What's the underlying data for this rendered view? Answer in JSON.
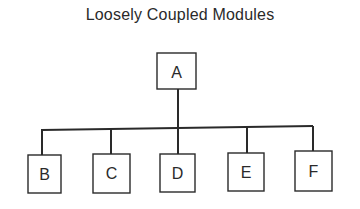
{
  "title": "Loosely Coupled Modules",
  "colors": {
    "stroke": "#2a2a2a",
    "background": "#ffffff"
  },
  "root": {
    "id": "A",
    "label": "A"
  },
  "children": [
    {
      "id": "B",
      "label": "B"
    },
    {
      "id": "C",
      "label": "C"
    },
    {
      "id": "D",
      "label": "D"
    },
    {
      "id": "E",
      "label": "E"
    },
    {
      "id": "F",
      "label": "F"
    }
  ],
  "edges": [
    {
      "from": "A",
      "to": "B"
    },
    {
      "from": "A",
      "to": "C"
    },
    {
      "from": "A",
      "to": "D"
    },
    {
      "from": "A",
      "to": "E"
    },
    {
      "from": "A",
      "to": "F"
    }
  ]
}
